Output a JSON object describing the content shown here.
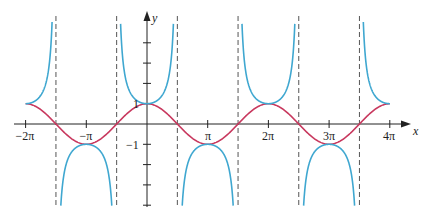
{
  "chart_data": {
    "type": "line",
    "title": "",
    "xlabel": "x",
    "ylabel": "y",
    "xlim": [
      -6.6,
      13.3
    ],
    "ylim": [
      -4,
      5.5
    ],
    "x_tick_labels": [
      "-2π",
      "-π",
      "π",
      "2π",
      "3π",
      "4π"
    ],
    "x_ticks": [
      -6.2832,
      -3.1416,
      3.1416,
      6.2832,
      9.4248,
      12.5664
    ],
    "y_tick_labels": [
      "1",
      "-1"
    ],
    "y_ticks": [
      1,
      -1
    ],
    "asymptotes": [
      -4.7124,
      -1.5708,
      1.5708,
      4.7124,
      7.854,
      10.9956
    ],
    "series": [
      {
        "name": "y = sec x",
        "color": "#3fa7d0",
        "function": "sec(x)"
      },
      {
        "name": "y = cos x",
        "color": "#c8385e",
        "function": "cos(x)"
      }
    ],
    "grid": false,
    "legend": "none"
  },
  "labels": {
    "x_axis": "x",
    "y_axis": "y",
    "one": "1",
    "minus_one": "−1",
    "neg2pi": "−2π",
    "negpi": "−π",
    "pi": "π",
    "twopi": "2π",
    "threepi": "3π",
    "fourpi": "4π"
  },
  "colors": {
    "sec": "#3fa7d0",
    "cos": "#c8385e",
    "axis": "#222222",
    "asymptote": "#555555"
  }
}
